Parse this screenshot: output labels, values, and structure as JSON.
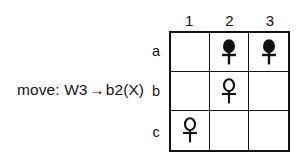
{
  "annotation": {
    "prefix": "move:",
    "from": "W3",
    "arrow": "→",
    "to": "b2(X)",
    "full_text": "move: W3 → b2(X)"
  },
  "board": {
    "columns": [
      "1",
      "2",
      "3"
    ],
    "rows": [
      "a",
      "b",
      "c"
    ],
    "border_color": "#111111",
    "background_color": "#ffffff",
    "piece_black_color": "#111111",
    "piece_white_color": "#ffffff",
    "cells": [
      [
        {
          "id": "a1",
          "piece": "empty"
        },
        {
          "id": "a2",
          "piece": "black-ankh"
        },
        {
          "id": "a3",
          "piece": "black-ankh"
        }
      ],
      [
        {
          "id": "b1",
          "piece": "empty"
        },
        {
          "id": "b2",
          "piece": "white-ankh"
        },
        {
          "id": "b3",
          "piece": "empty"
        }
      ],
      [
        {
          "id": "c1",
          "piece": "white-ankh"
        },
        {
          "id": "c2",
          "piece": "empty"
        },
        {
          "id": "c3",
          "piece": "empty"
        }
      ]
    ]
  }
}
